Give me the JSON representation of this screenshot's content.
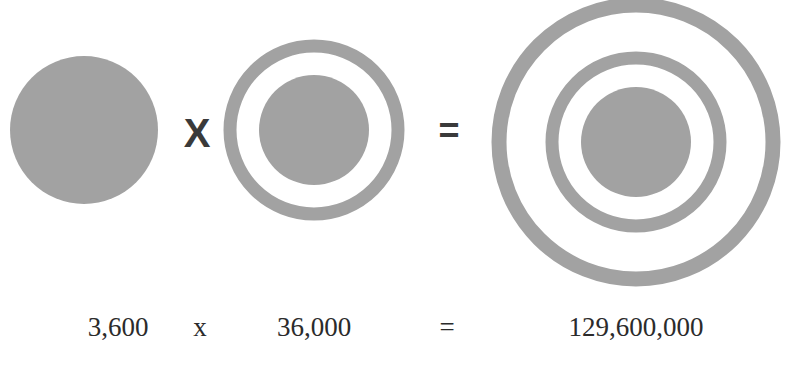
{
  "figure": {
    "fill_color": "#a2a2a2",
    "operator_color": "#3a3a3a",
    "text_color": "#2b2b2b",
    "operands": [
      {
        "name": "single-circle",
        "center": [
          84,
          130
        ],
        "rings": [],
        "core_radius": 74
      },
      {
        "name": "one-ring-target",
        "center": [
          314,
          130
        ],
        "rings": [
          {
            "r": 84,
            "width": 13
          }
        ],
        "core_radius": 55
      },
      {
        "name": "two-ring-target",
        "center": [
          636,
          142
        ],
        "rings": [
          {
            "r": 137,
            "width": 15
          },
          {
            "r": 84,
            "width": 13
          }
        ],
        "core_radius": 55
      }
    ],
    "operators": {
      "multiply": "X",
      "equals": "="
    }
  },
  "equation": {
    "term1": "3,600",
    "times": "x",
    "term2": "36,000",
    "equals": "=",
    "result": "129,600,000"
  }
}
